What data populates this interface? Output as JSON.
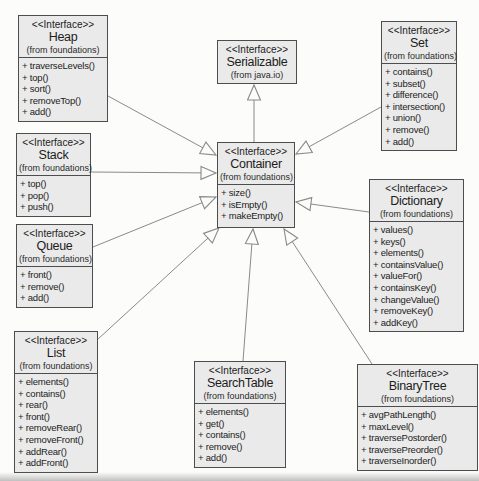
{
  "diagram": {
    "title": "",
    "colors": {
      "node_fill": "#eaeaea",
      "node_border": "#4d4d4d",
      "line": "#8a8a8a",
      "background": "#fcfcfb"
    },
    "nodes": [
      {
        "id": "heap",
        "stereotype": "<<Interface>>",
        "name": "Heap",
        "package": "(from foundations)",
        "methods": [
          "+ traverseLevels()",
          "+ top()",
          "+ sort()",
          "+ removeTop()",
          "+ add()"
        ]
      },
      {
        "id": "stack",
        "stereotype": "<<Interface>>",
        "name": "Stack",
        "package": "(from foundations)",
        "methods": [
          "+ top()",
          "+ pop()",
          "+ push()"
        ]
      },
      {
        "id": "queue",
        "stereotype": "<<Interface>>",
        "name": "Queue",
        "package": "(from foundations)",
        "methods": [
          "+ front()",
          "+ remove()",
          "+ add()"
        ]
      },
      {
        "id": "list",
        "stereotype": "<<Interface>>",
        "name": "List",
        "package": "(from foundations)",
        "methods": [
          "+ elements()",
          "+ contains()",
          "+ rear()",
          "+ front()",
          "+ removeRear()",
          "+ removeFront()",
          "+ addRear()",
          "+ addFront()"
        ]
      },
      {
        "id": "serializable",
        "stereotype": "<<Interface>>",
        "name": "Serializable",
        "package": "(from java.io)",
        "methods": []
      },
      {
        "id": "container",
        "stereotype": "<<Interface>>",
        "name": "Container",
        "package": "(from foundations)",
        "methods": [
          "+ size()",
          "+ isEmpty()",
          "+ makeEmpty()"
        ]
      },
      {
        "id": "set",
        "stereotype": "<<Interface>>",
        "name": "Set",
        "package": "(from foundations)",
        "methods": [
          "+ contains()",
          "+ subset()",
          "+ difference()",
          "+ intersection()",
          "+ union()",
          "+ remove()",
          "+ add()"
        ]
      },
      {
        "id": "dictionary",
        "stereotype": "<<Interface>>",
        "name": "Dictionary",
        "package": "(from foundations)",
        "methods": [
          "+ values()",
          "+ keys()",
          "+ elements()",
          "+ containsValue()",
          "+ valueFor()",
          "+ containsKey()",
          "+ changeValue()",
          "+ removeKey()",
          "+ addKey()"
        ]
      },
      {
        "id": "searchtable",
        "stereotype": "<<Interface>>",
        "name": "SearchTable",
        "package": "(from foundations)",
        "methods": [
          "+ elements()",
          "+ get()",
          "+ contains()",
          "+ remove()",
          "+ add()"
        ]
      },
      {
        "id": "binarytree",
        "stereotype": "<<Interface>>",
        "name": "BinaryTree",
        "package": "(from foundations)",
        "methods": [
          "+ avgPathLength()",
          "+ maxLevel()",
          "+ traversePostorder()",
          "+ traversePreorder()",
          "+ traverseInorder()"
        ]
      }
    ],
    "edges": [
      {
        "from": "heap",
        "to": "container",
        "type": "generalization"
      },
      {
        "from": "stack",
        "to": "container",
        "type": "generalization"
      },
      {
        "from": "queue",
        "to": "container",
        "type": "generalization"
      },
      {
        "from": "list",
        "to": "container",
        "type": "generalization"
      },
      {
        "from": "searchtable",
        "to": "container",
        "type": "generalization"
      },
      {
        "from": "binarytree",
        "to": "container",
        "type": "generalization"
      },
      {
        "from": "set",
        "to": "container",
        "type": "generalization"
      },
      {
        "from": "dictionary",
        "to": "container",
        "type": "generalization"
      },
      {
        "from": "container",
        "to": "serializable",
        "type": "generalization"
      }
    ]
  }
}
